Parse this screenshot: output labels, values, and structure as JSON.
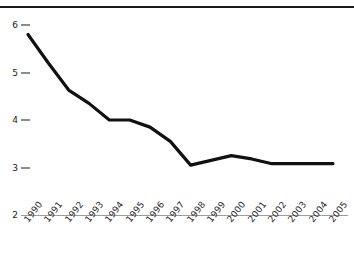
{
  "chart_data": {
    "type": "line",
    "title": "",
    "subtitle": "",
    "xlabel": "",
    "ylabel": "",
    "categories": [
      "1990",
      "1991",
      "1992",
      "1993",
      "1994",
      "1995",
      "1996",
      "1997",
      "1998",
      "1999",
      "2000",
      "2001",
      "2002",
      "2003",
      "2004",
      "2005"
    ],
    "values": [
      5.8,
      5.2,
      4.63,
      4.35,
      4.0,
      4.0,
      3.85,
      3.55,
      3.05,
      3.15,
      3.25,
      3.18,
      3.08,
      3.08,
      3.08,
      3.08
    ],
    "series": [
      {
        "name": "series-1",
        "values": [
          5.8,
          5.2,
          4.63,
          4.35,
          4.0,
          4.0,
          3.85,
          3.55,
          3.05,
          3.15,
          3.25,
          3.18,
          3.08,
          3.08,
          3.08,
          3.08
        ]
      }
    ],
    "ylim": [
      2,
      6
    ],
    "xlim": [
      "1990",
      "2005"
    ],
    "y_ticks": [
      2,
      3,
      4,
      5,
      6
    ],
    "y_tick_labels": [
      "2",
      "3",
      "4",
      "5",
      "6"
    ],
    "grid": false,
    "legend": false,
    "legend_position": "none",
    "line_color": "#111111",
    "line_width": 3.2,
    "annotations": []
  },
  "axes": {
    "y_tick_labels": [
      "6",
      "5",
      "4",
      "3",
      "2"
    ],
    "x_tick_labels": [
      "1990",
      "1991",
      "1992",
      "1993",
      "1994",
      "1995",
      "1996",
      "1997",
      "1998",
      "1999",
      "2000",
      "2001",
      "2002",
      "2003",
      "2004",
      "2005"
    ]
  },
  "decor": {
    "top_rule_color": "#1a1a1a",
    "baseline_color": "#9d9d9d",
    "clipped_text_above_rule": ""
  }
}
